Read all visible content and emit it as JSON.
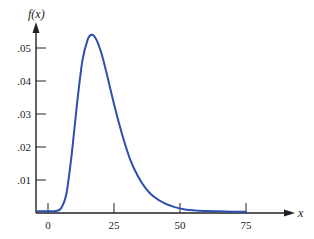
{
  "chart_data": {
    "type": "line",
    "title": "",
    "xlabel": "x",
    "ylabel": "f(x)",
    "x_ticks": [
      0,
      25,
      50,
      75
    ],
    "x_tick_labels": [
      "0",
      "25",
      "50",
      "75"
    ],
    "y_ticks": [
      0.01,
      0.02,
      0.03,
      0.04,
      0.05
    ],
    "y_tick_labels": [
      ".01",
      ".02",
      ".03",
      ".04",
      ".05"
    ],
    "xlim": [
      -4,
      93
    ],
    "ylim": [
      0,
      0.06
    ],
    "grid": false,
    "legend": null,
    "series": [
      {
        "name": "f(x)",
        "color": "#2d4fb0",
        "x": [
          -4,
          0,
          3,
          5,
          7,
          9,
          11,
          13,
          15,
          16.5,
          18,
          20,
          22,
          25,
          28,
          31,
          34,
          37,
          40,
          44,
          48,
          52,
          56,
          60,
          65,
          70,
          75
        ],
        "y": [
          0.0005,
          0.0005,
          0.0006,
          0.0015,
          0.006,
          0.018,
          0.033,
          0.046,
          0.0525,
          0.054,
          0.053,
          0.049,
          0.043,
          0.033,
          0.024,
          0.0165,
          0.0112,
          0.0075,
          0.005,
          0.003,
          0.0018,
          0.0011,
          0.0008,
          0.0006,
          0.0005,
          0.0004,
          0.0004
        ]
      }
    ]
  }
}
